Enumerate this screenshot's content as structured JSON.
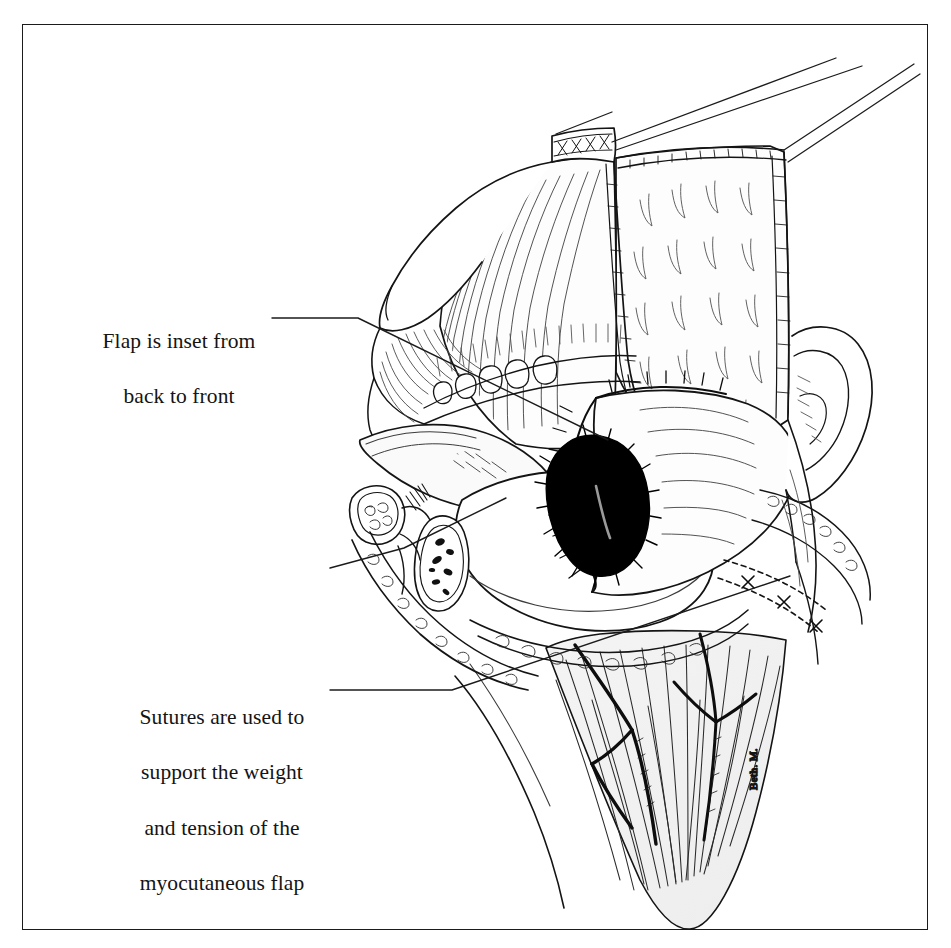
{
  "figure": {
    "kind": "line-art-medical-illustration",
    "background_color": "#ffffff",
    "ink_color": "#141414",
    "shading_fill": "#f2f2f2",
    "necrotic_fill": "#000000",
    "border": {
      "present": true,
      "color": "#1b1b1b",
      "inset_left": 22,
      "inset_top": 24,
      "width": 906,
      "height": 906
    }
  },
  "annotations": [
    {
      "id": "flap-inset",
      "lines": [
        "Flap is inset from",
        "back to front"
      ],
      "text": "Flap is inset from\nback to front",
      "leader": "horizontal-then-diagonal-down-right"
    },
    {
      "id": "sutures-support",
      "lines": [
        "Sutures are used to",
        "support the weight",
        "and tension of the",
        "myocutaneous flap"
      ],
      "text": "Sutures are used to\nsupport the weight\nand tension of the\nmyocutaneous flap",
      "leader": "horizontal-then-diagonal-up-right"
    }
  ],
  "signature": {
    "text": "Beth. M.",
    "orientation": "rotated-vertical",
    "x": 757,
    "y": 790
  },
  "anatomy_labels": {
    "flap_paddle": "skin paddle of myocutaneous flap",
    "muscle_pedicle": "muscle pedicle with fiber striations",
    "teeth": "maxillary teeth",
    "tongue": "tongue",
    "defect": "necrotic / cauterized defect area",
    "ear": "auricle",
    "neck": "neck with branching vessels",
    "cross_section": "cut cross-section of lip and mandible"
  }
}
